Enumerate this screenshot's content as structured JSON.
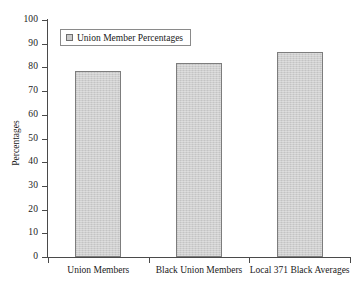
{
  "chart_data": {
    "type": "bar",
    "title": "",
    "subtitle": "",
    "xlabel": "",
    "ylabel": "Percentages",
    "categories": [
      "Union Members",
      "Black Union Members",
      "Local 371 Black Averages"
    ],
    "values": [
      78.5,
      82,
      86.5
    ],
    "series": [
      {
        "name": "Union Member Percentages",
        "values": [
          78.5,
          82,
          86.5
        ],
        "color": "#cacaca",
        "edge_color": "#7d7d7d"
      }
    ],
    "ylim": [
      0,
      100
    ],
    "ytick_step": 10,
    "yticks": [
      0,
      10,
      20,
      30,
      40,
      50,
      60,
      70,
      80,
      90,
      100
    ],
    "ytick_labels": [
      "0",
      "10",
      "20",
      "30",
      "40",
      "50",
      "60",
      "70",
      "80",
      "90",
      "100"
    ],
    "grid": false,
    "legend_position": "upper-left",
    "legend_entries": [
      "Union Member Percentages"
    ],
    "annotations": []
  },
  "legend": {
    "label": "Union Member Percentages",
    "swatch_name": "legend-color-swatch"
  },
  "axes": {
    "y_title": "Percentages",
    "x_title": ""
  },
  "colors": {
    "bar_fill": "#cacaca",
    "bar_edge": "#7d7d7d",
    "axis": "#4a4a4a",
    "text": "#1a1a1a",
    "background": "#ffffff"
  }
}
